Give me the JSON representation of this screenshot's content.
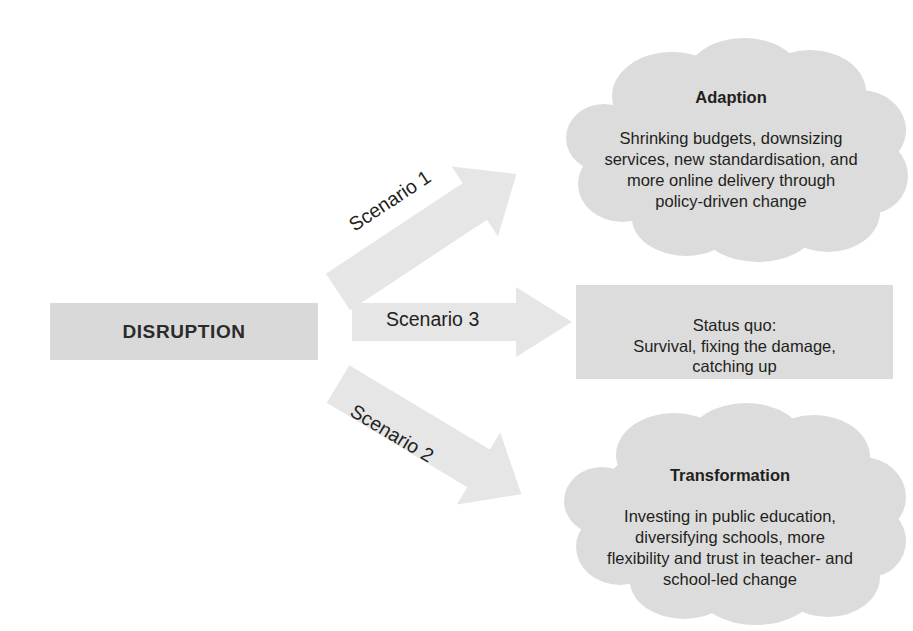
{
  "diagram": {
    "colors": {
      "background": "#ffffff",
      "box_fill": "#d9d9d9",
      "cloud_fill": "#dcdcdc",
      "arrow_fill": "#e6e6e6",
      "text": "#231f20"
    },
    "source": {
      "label": "DISRUPTION"
    },
    "arrows": [
      {
        "id": "scenario-1",
        "label": "Scenario 1",
        "direction": "up-right",
        "from": "DISRUPTION",
        "to": "Adaption"
      },
      {
        "id": "scenario-3",
        "label": "Scenario 3",
        "direction": "right",
        "from": "DISRUPTION",
        "to": "Status quo"
      },
      {
        "id": "scenario-2",
        "label": "Scenario 2",
        "direction": "down-right",
        "from": "DISRUPTION",
        "to": "Transformation"
      }
    ],
    "outcomes": [
      {
        "id": "adaption",
        "shape": "cloud",
        "title": "Adaption",
        "body": "Shrinking budgets, downsizing\nservices, new standardisation, and\nmore online delivery through\npolicy-driven change"
      },
      {
        "id": "status-quo",
        "shape": "rectangle",
        "title": "",
        "body": "Status quo:\nSurvival, fixing the damage,\ncatching up"
      },
      {
        "id": "transformation",
        "shape": "cloud",
        "title": "Transformation",
        "body": "Investing in public education,\ndiversifying schools, more\nflexibility and trust in teacher- and\nschool-led change"
      }
    ]
  }
}
